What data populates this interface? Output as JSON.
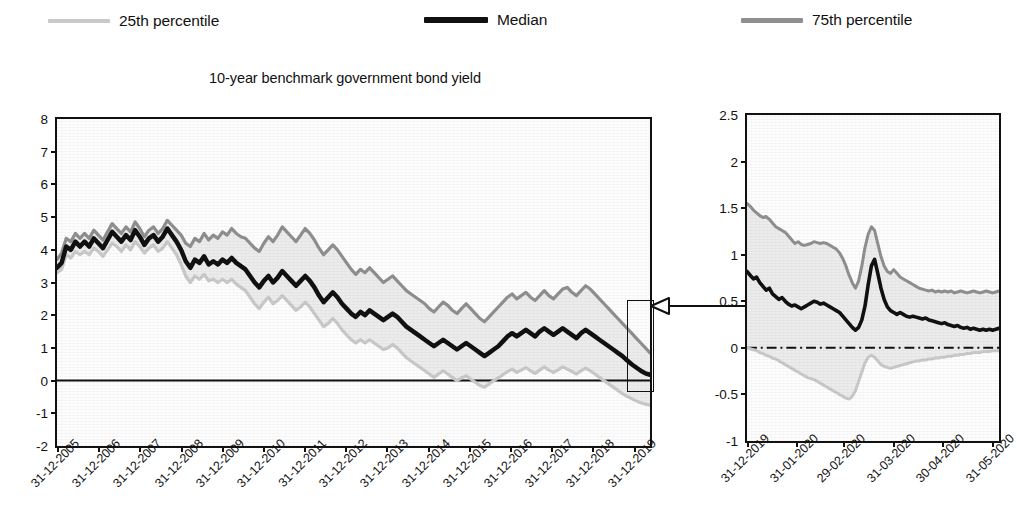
{
  "legend": {
    "items": [
      {
        "label": "25th percentile",
        "color": "#c9c9c9",
        "key": "p25"
      },
      {
        "label": "Median",
        "color": "#111111",
        "key": "median"
      },
      {
        "label": "75th percentile",
        "color": "#8f8f8f",
        "key": "p75"
      }
    ]
  },
  "title": "10-year benchmark government bond yield",
  "callout": {
    "arrow_icon": "left-arrow-icon"
  },
  "chart_data": [
    {
      "id": "main-chart",
      "type": "line",
      "title": "10-year benchmark government bond yield",
      "xlabel": "",
      "ylabel": "",
      "ylim": [
        -2,
        8
      ],
      "ytick_step": 1,
      "yticks": [
        "8",
        "7",
        "6",
        "5",
        "4",
        "3",
        "2",
        "1",
        "0",
        "-1",
        "-2"
      ],
      "grid": false,
      "legend_position": "top",
      "zero_line": true,
      "categories": [
        "31-12-2005",
        "31-12-2006",
        "31-12-2007",
        "31-12-2008",
        "31-12-2009",
        "31-12-2010",
        "31-12-2011",
        "31-12-2012",
        "31-12-2013",
        "31-12-2014",
        "31-12-2015",
        "31-12-2016",
        "31-12-2017",
        "31-12-2018",
        "31-12-2019"
      ],
      "x_fraction": [
        0.0,
        0.0694,
        0.1389,
        0.2083,
        0.2778,
        0.3472,
        0.4167,
        0.4861,
        0.5556,
        0.625,
        0.6944,
        0.7639,
        0.8333,
        0.9028,
        0.9722
      ],
      "series": [
        {
          "name": "Median",
          "color": "#111111",
          "values": [
            3.45,
            3.6,
            4.1,
            4.0,
            4.25,
            4.1,
            4.25,
            4.1,
            4.35,
            4.2,
            4.05,
            4.3,
            4.55,
            4.4,
            4.25,
            4.45,
            4.3,
            4.6,
            4.4,
            4.15,
            4.35,
            4.45,
            4.25,
            4.4,
            4.65,
            4.45,
            4.25,
            4.0,
            3.65,
            3.45,
            3.7,
            3.6,
            3.8,
            3.55,
            3.65,
            3.55,
            3.7,
            3.6,
            3.75,
            3.6,
            3.5,
            3.4,
            3.2,
            3.0,
            2.85,
            3.05,
            3.2,
            3.0,
            3.15,
            3.35,
            3.2,
            3.05,
            2.9,
            3.05,
            3.2,
            3.05,
            2.85,
            2.6,
            2.4,
            2.55,
            2.7,
            2.55,
            2.35,
            2.2,
            2.05,
            1.95,
            2.1,
            2.0,
            2.15,
            2.05,
            1.95,
            1.85,
            1.95,
            2.05,
            1.95,
            1.8,
            1.65,
            1.55,
            1.45,
            1.35,
            1.25,
            1.15,
            1.05,
            1.15,
            1.25,
            1.15,
            1.05,
            0.95,
            1.05,
            1.15,
            1.05,
            0.95,
            0.85,
            0.75,
            0.85,
            0.95,
            1.05,
            1.2,
            1.35,
            1.45,
            1.35,
            1.45,
            1.55,
            1.45,
            1.35,
            1.5,
            1.6,
            1.5,
            1.4,
            1.5,
            1.6,
            1.5,
            1.4,
            1.3,
            1.45,
            1.55,
            1.45,
            1.35,
            1.25,
            1.15,
            1.05,
            0.95,
            0.85,
            0.75,
            0.62,
            0.5,
            0.4,
            0.3,
            0.22,
            0.18
          ]
        },
        {
          "name": "75th percentile",
          "color": "#8f8f8f",
          "values": [
            3.7,
            3.9,
            4.35,
            4.25,
            4.5,
            4.35,
            4.5,
            4.35,
            4.6,
            4.45,
            4.3,
            4.55,
            4.8,
            4.65,
            4.5,
            4.7,
            4.55,
            4.85,
            4.65,
            4.4,
            4.6,
            4.7,
            4.5,
            4.65,
            4.9,
            4.75,
            4.6,
            4.45,
            4.2,
            4.1,
            4.35,
            4.25,
            4.5,
            4.3,
            4.45,
            4.35,
            4.55,
            4.45,
            4.65,
            4.5,
            4.4,
            4.35,
            4.2,
            4.05,
            3.95,
            4.2,
            4.4,
            4.25,
            4.45,
            4.7,
            4.55,
            4.4,
            4.25,
            4.45,
            4.65,
            4.5,
            4.3,
            4.05,
            3.85,
            4.0,
            4.15,
            4.0,
            3.8,
            3.6,
            3.4,
            3.25,
            3.4,
            3.3,
            3.45,
            3.3,
            3.15,
            3.0,
            3.1,
            3.2,
            3.05,
            2.9,
            2.75,
            2.65,
            2.55,
            2.45,
            2.35,
            2.2,
            2.1,
            2.25,
            2.4,
            2.3,
            2.15,
            2.05,
            2.2,
            2.35,
            2.2,
            2.05,
            1.9,
            1.8,
            1.95,
            2.1,
            2.25,
            2.4,
            2.55,
            2.65,
            2.5,
            2.6,
            2.7,
            2.55,
            2.45,
            2.6,
            2.75,
            2.6,
            2.5,
            2.65,
            2.8,
            2.85,
            2.7,
            2.6,
            2.75,
            2.9,
            2.8,
            2.65,
            2.5,
            2.35,
            2.2,
            2.05,
            1.9,
            1.75,
            1.6,
            1.45,
            1.3,
            1.15,
            1.0,
            0.85
          ]
        },
        {
          "name": "25th percentile",
          "color": "#c9c9c9",
          "values": [
            3.3,
            3.4,
            3.85,
            3.75,
            3.95,
            3.85,
            3.95,
            3.85,
            4.05,
            3.95,
            3.8,
            4.0,
            4.2,
            4.1,
            3.95,
            4.15,
            4.0,
            4.25,
            4.1,
            3.9,
            4.05,
            4.15,
            3.95,
            4.05,
            4.25,
            4.05,
            3.85,
            3.55,
            3.2,
            3.0,
            3.2,
            3.1,
            3.25,
            3.05,
            3.1,
            3.0,
            3.1,
            3.0,
            3.1,
            2.95,
            2.85,
            2.75,
            2.55,
            2.35,
            2.2,
            2.4,
            2.55,
            2.35,
            2.45,
            2.6,
            2.45,
            2.3,
            2.15,
            2.25,
            2.4,
            2.25,
            2.05,
            1.85,
            1.65,
            1.75,
            1.9,
            1.75,
            1.55,
            1.4,
            1.25,
            1.15,
            1.25,
            1.15,
            1.25,
            1.15,
            1.05,
            0.95,
            1.0,
            1.1,
            1.0,
            0.85,
            0.7,
            0.6,
            0.5,
            0.4,
            0.3,
            0.2,
            0.1,
            0.2,
            0.3,
            0.2,
            0.1,
            0.0,
            0.08,
            0.15,
            0.05,
            -0.05,
            -0.15,
            -0.2,
            -0.1,
            0.0,
            0.08,
            0.18,
            0.28,
            0.35,
            0.25,
            0.32,
            0.4,
            0.3,
            0.22,
            0.32,
            0.42,
            0.32,
            0.25,
            0.33,
            0.42,
            0.35,
            0.28,
            0.2,
            0.3,
            0.38,
            0.3,
            0.2,
            0.1,
            0.0,
            -0.1,
            -0.2,
            -0.3,
            -0.4,
            -0.48,
            -0.55,
            -0.62,
            -0.68,
            -0.72,
            -0.75
          ]
        }
      ],
      "highlight_box": {
        "x_start_fraction": 0.962,
        "x_end_fraction": 1.0,
        "y_top": 2.45,
        "y_bottom": -0.35
      }
    },
    {
      "id": "zoom-chart",
      "type": "line",
      "title": "",
      "xlabel": "",
      "ylabel": "",
      "ylim": [
        -1,
        2.5
      ],
      "ytick_step": 0.5,
      "yticks": [
        "2.5",
        "2",
        "1.5",
        "1",
        "0.5",
        "0",
        "-0.5",
        "-1"
      ],
      "grid": false,
      "legend_position": "top",
      "zero_line": true,
      "categories": [
        "31-12-2019",
        "31-01-2020",
        "29-02-2020",
        "31-03-2020",
        "30-04-2020",
        "31-05-2020"
      ],
      "x_fraction": [
        0.0,
        0.1935,
        0.3806,
        0.5806,
        0.7742,
        0.9742
      ],
      "series": [
        {
          "name": "Median",
          "color": "#111111",
          "values": [
            0.82,
            0.78,
            0.74,
            0.76,
            0.7,
            0.66,
            0.62,
            0.64,
            0.58,
            0.55,
            0.52,
            0.54,
            0.5,
            0.47,
            0.45,
            0.46,
            0.44,
            0.42,
            0.44,
            0.46,
            0.48,
            0.5,
            0.49,
            0.47,
            0.48,
            0.46,
            0.44,
            0.42,
            0.4,
            0.38,
            0.34,
            0.3,
            0.26,
            0.22,
            0.19,
            0.22,
            0.3,
            0.45,
            0.68,
            0.88,
            0.95,
            0.8,
            0.64,
            0.52,
            0.44,
            0.4,
            0.38,
            0.36,
            0.38,
            0.36,
            0.34,
            0.33,
            0.34,
            0.33,
            0.32,
            0.31,
            0.32,
            0.3,
            0.29,
            0.28,
            0.27,
            0.26,
            0.27,
            0.25,
            0.24,
            0.23,
            0.24,
            0.22,
            0.21,
            0.22,
            0.2,
            0.21,
            0.2,
            0.19,
            0.2,
            0.19,
            0.2,
            0.19,
            0.2,
            0.21
          ]
        },
        {
          "name": "75th percentile",
          "color": "#8f8f8f",
          "values": [
            1.55,
            1.52,
            1.48,
            1.45,
            1.42,
            1.4,
            1.41,
            1.38,
            1.34,
            1.3,
            1.28,
            1.26,
            1.24,
            1.2,
            1.16,
            1.12,
            1.14,
            1.11,
            1.1,
            1.11,
            1.12,
            1.14,
            1.13,
            1.12,
            1.13,
            1.12,
            1.1,
            1.08,
            1.06,
            1.02,
            0.96,
            0.88,
            0.78,
            0.7,
            0.64,
            0.72,
            0.88,
            1.08,
            1.22,
            1.3,
            1.26,
            1.12,
            0.98,
            0.88,
            0.82,
            0.8,
            0.84,
            0.8,
            0.76,
            0.74,
            0.72,
            0.7,
            0.68,
            0.66,
            0.64,
            0.63,
            0.62,
            0.61,
            0.62,
            0.6,
            0.61,
            0.6,
            0.61,
            0.6,
            0.61,
            0.59,
            0.6,
            0.61,
            0.6,
            0.59,
            0.6,
            0.61,
            0.6,
            0.59,
            0.6,
            0.61,
            0.6,
            0.59,
            0.6,
            0.61
          ]
        },
        {
          "name": "25th percentile",
          "color": "#c9c9c9",
          "values": [
            0.0,
            -0.01,
            -0.02,
            -0.03,
            -0.05,
            -0.06,
            -0.08,
            -0.09,
            -0.11,
            -0.12,
            -0.14,
            -0.16,
            -0.18,
            -0.2,
            -0.22,
            -0.24,
            -0.26,
            -0.28,
            -0.3,
            -0.32,
            -0.33,
            -0.34,
            -0.36,
            -0.38,
            -0.4,
            -0.42,
            -0.44,
            -0.46,
            -0.48,
            -0.5,
            -0.52,
            -0.54,
            -0.55,
            -0.52,
            -0.46,
            -0.36,
            -0.26,
            -0.16,
            -0.1,
            -0.08,
            -0.1,
            -0.14,
            -0.18,
            -0.2,
            -0.21,
            -0.22,
            -0.21,
            -0.2,
            -0.19,
            -0.18,
            -0.17,
            -0.16,
            -0.15,
            -0.14,
            -0.14,
            -0.13,
            -0.13,
            -0.12,
            -0.12,
            -0.11,
            -0.11,
            -0.1,
            -0.1,
            -0.09,
            -0.09,
            -0.08,
            -0.08,
            -0.07,
            -0.07,
            -0.06,
            -0.06,
            -0.05,
            -0.05,
            -0.05,
            -0.04,
            -0.04,
            -0.04,
            -0.03,
            -0.03,
            -0.03
          ]
        }
      ]
    }
  ]
}
